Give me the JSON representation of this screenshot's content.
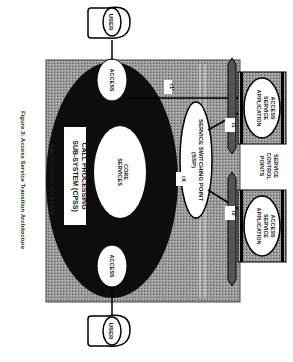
{
  "figure": {
    "caption": "Figure 3: Access Service Transition Architecture",
    "orientation": "rotated 90° clockwise"
  },
  "switching_system": {
    "label": "SWITCHING SYSTEM"
  },
  "cpss": {
    "label_line1": "CALL PROCESSING",
    "label_line2": "SUB-SYSTEM (CPSS)",
    "core_line1": "CORE",
    "core_line2": "SERVICES"
  },
  "access_nodes": [
    {
      "label": "ACCESS"
    },
    {
      "label": "ACCESS"
    }
  ],
  "users": [
    {
      "label": "USER"
    },
    {
      "label": "USER"
    }
  ],
  "ssp": {
    "line1": "SERVICE SWITCHING POINT",
    "line2": "(SSP)"
  },
  "interfaces": {
    "r1_prime": "r1'",
    "r1": "r1",
    "r2": "r2",
    "rx": "rX"
  },
  "scp": {
    "label_line1": "SERVICE",
    "label_line2": "CONTROL",
    "label_line3": "POINTS",
    "apps": [
      {
        "line1": "ACCESS",
        "line2": "SERVICE",
        "line3": "APPLICATION"
      },
      {
        "line1": "ACCESS",
        "line2": "SERVICE",
        "line3": "APPLICATION"
      }
    ]
  },
  "colors": {
    "gray_fill": "#8a8a8a",
    "black": "#0d0d0d",
    "white": "#ffffff"
  }
}
